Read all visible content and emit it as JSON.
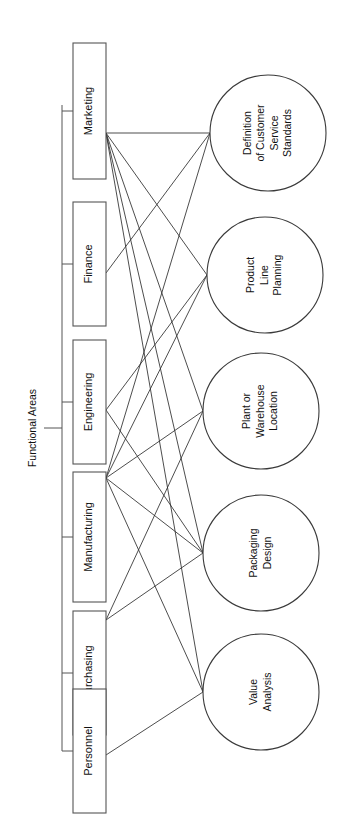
{
  "diagram": {
    "type": "bipartite-relationship-diagram",
    "orientation": "rotated-90-ccw",
    "group_label": "Functional Areas",
    "functional_areas": [
      {
        "id": "marketing",
        "label": "Marketing",
        "cx": 90,
        "cy": 133,
        "box": {
          "x": 73,
          "y": 43,
          "w": 33,
          "h": 136
        }
      },
      {
        "id": "finance",
        "label": "Finance",
        "cx": 90,
        "cy": 273,
        "box": {
          "x": 73,
          "y": 202,
          "w": 33,
          "h": 124
        }
      },
      {
        "id": "engineering",
        "label": "Engineering",
        "cx": 90,
        "cy": 410,
        "box": {
          "x": 73,
          "y": 340,
          "w": 33,
          "h": 124
        }
      },
      {
        "id": "manufacturing",
        "label": "Manufacturing",
        "cx": 90,
        "cy": 478,
        "box": {
          "x": 73,
          "y": 472,
          "w": 33,
          "h": 130
        }
      },
      {
        "id": "purchasing",
        "label": "Purchasing",
        "cx": 90,
        "cy": 620,
        "box": {
          "x": 73,
          "y": 611,
          "w": 33,
          "h": 124
        }
      },
      {
        "id": "personnel",
        "label": "Personnel",
        "cx": 90,
        "cy": 755,
        "box": {
          "x": 73,
          "y": 689,
          "w": 33,
          "h": 124
        }
      }
    ],
    "decision_areas": [
      {
        "id": "customer-service-standards",
        "lines": [
          "Definition",
          "of Customer",
          "Service",
          "Standards"
        ],
        "cx": 268,
        "cy": 133,
        "r": 58,
        "entry": {
          "x": 210,
          "y": 133
        }
      },
      {
        "id": "product-line-planning",
        "lines": [
          "Product",
          "Line",
          "Planning"
        ],
        "cx": 265,
        "cy": 275,
        "r": 58,
        "entry": {
          "x": 207,
          "y": 275
        }
      },
      {
        "id": "plant-warehouse-location",
        "lines": [
          "Plant or",
          "Warehouse",
          "Location"
        ],
        "cx": 261,
        "cy": 411,
        "r": 58,
        "entry": {
          "x": 203,
          "y": 411
        }
      },
      {
        "id": "packaging-design",
        "lines": [
          "Packaging",
          "Design"
        ],
        "cx": 261,
        "cy": 553,
        "r": 58,
        "entry": {
          "x": 203,
          "y": 553
        }
      },
      {
        "id": "value-analysis",
        "lines": [
          "Value",
          "Analysis"
        ],
        "cx": 261,
        "cy": 692,
        "r": 58,
        "entry": {
          "x": 203,
          "y": 692
        }
      }
    ],
    "connections": [
      {
        "from": "marketing",
        "to": "customer-service-standards"
      },
      {
        "from": "marketing",
        "to": "product-line-planning"
      },
      {
        "from": "marketing",
        "to": "plant-warehouse-location"
      },
      {
        "from": "marketing",
        "to": "packaging-design"
      },
      {
        "from": "marketing",
        "to": "value-analysis"
      },
      {
        "from": "finance",
        "to": "customer-service-standards"
      },
      {
        "from": "engineering",
        "to": "product-line-planning"
      },
      {
        "from": "engineering",
        "to": "packaging-design"
      },
      {
        "from": "manufacturing",
        "to": "customer-service-standards"
      },
      {
        "from": "manufacturing",
        "to": "product-line-planning"
      },
      {
        "from": "manufacturing",
        "to": "plant-warehouse-location"
      },
      {
        "from": "manufacturing",
        "to": "packaging-design"
      },
      {
        "from": "manufacturing",
        "to": "value-analysis"
      },
      {
        "from": "purchasing",
        "to": "plant-warehouse-location"
      },
      {
        "from": "purchasing",
        "to": "packaging-design"
      },
      {
        "from": "personnel",
        "to": "value-analysis"
      }
    ],
    "bracket": {
      "spine_x": 62,
      "spine_y1": 105,
      "spine_y2": 751,
      "stem_x1": 44,
      "stem_y": 428,
      "label_x": 33,
      "label_y": 428
    },
    "colors": {
      "background": "#ffffff",
      "box_stroke": "#555555",
      "circle_stroke": "#3a3a3a",
      "line_stroke": "#2d2d2d",
      "text": "#111111"
    }
  }
}
